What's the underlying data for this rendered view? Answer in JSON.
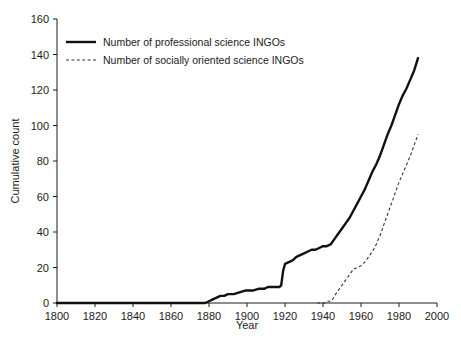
{
  "chart_data": {
    "type": "line",
    "title": "",
    "xlabel": "Year",
    "ylabel": "Cumulative count",
    "xlim": [
      1800,
      2000
    ],
    "ylim": [
      0,
      160
    ],
    "xticks": [
      1800,
      1820,
      1840,
      1860,
      1880,
      1900,
      1920,
      1940,
      1960,
      1980,
      2000
    ],
    "yticks": [
      0,
      20,
      40,
      60,
      80,
      100,
      120,
      140,
      160
    ],
    "grid": false,
    "legend_position": "top-left",
    "series": [
      {
        "name": "Number of professional science INGOs",
        "style": "solid",
        "color": "#111111",
        "x": [
          1800,
          1878,
          1880,
          1882,
          1884,
          1886,
          1888,
          1890,
          1893,
          1896,
          1899,
          1901,
          1903,
          1906,
          1909,
          1911,
          1913,
          1915,
          1917,
          1918,
          1919,
          1920,
          1922,
          1924,
          1926,
          1928,
          1930,
          1932,
          1934,
          1936,
          1938,
          1940,
          1942,
          1944,
          1946,
          1948,
          1950,
          1952,
          1954,
          1956,
          1958,
          1960,
          1962,
          1964,
          1966,
          1968,
          1970,
          1972,
          1974,
          1976,
          1978,
          1980,
          1982,
          1984,
          1986,
          1988,
          1990
        ],
        "y": [
          0,
          0,
          1,
          2,
          3,
          4,
          4,
          5,
          5,
          6,
          7,
          7,
          7,
          8,
          8,
          9,
          9,
          9,
          9,
          10,
          18,
          22,
          23,
          24,
          26,
          27,
          28,
          29,
          30,
          30,
          31,
          32,
          32,
          33,
          36,
          39,
          42,
          45,
          48,
          52,
          56,
          60,
          64,
          69,
          74,
          78,
          83,
          89,
          95,
          100,
          106,
          112,
          117,
          121,
          126,
          131,
          138
        ]
      },
      {
        "name": "Number of socially oriented science INGOs",
        "style": "dashed",
        "color": "#333333",
        "x": [
          1937,
          1939,
          1940,
          1941,
          1942,
          1943,
          1944,
          1945,
          1946,
          1948,
          1950,
          1952,
          1954,
          1956,
          1958,
          1960,
          1962,
          1964,
          1966,
          1968,
          1970,
          1972,
          1974,
          1976,
          1978,
          1980,
          1982,
          1984,
          1986,
          1988,
          1990
        ],
        "y": [
          0,
          0,
          0,
          0,
          1,
          1,
          1,
          2,
          4,
          7,
          10,
          13,
          16,
          19,
          20,
          21,
          23,
          26,
          29,
          33,
          38,
          44,
          50,
          56,
          62,
          68,
          73,
          78,
          83,
          89,
          95
        ]
      }
    ]
  },
  "legend": {
    "entries": [
      {
        "label": "Number of professional science INGOs"
      },
      {
        "label": "Number of socially oriented science INGOs"
      }
    ]
  }
}
